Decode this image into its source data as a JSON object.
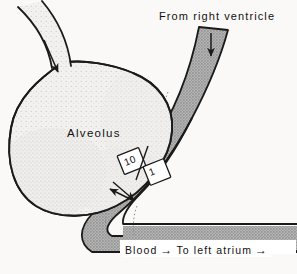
{
  "figure": {
    "background_color": "#faf9f7",
    "ink_color": "#1a1a1a",
    "vessel_fill_color": "#a9a9a9",
    "alveolus_fill_color": "#f1f0ee"
  },
  "labels": {
    "from_right_ventricle": "From right ventricle",
    "alveolus": "Alveolus",
    "blood": "Blood",
    "to_left_atrium": "To left atrium",
    "arrow_glyph": "→"
  },
  "ratio_boxes": [
    {
      "name": "alveolar-side-value",
      "value": "10"
    },
    {
      "name": "blood-side-value",
      "value": "1"
    }
  ],
  "flow_arrows": [
    {
      "name": "airway-inflow-arrow",
      "direction": "down-right",
      "location": "bronchiole"
    },
    {
      "name": "pulmonary-artery-inflow-arrow",
      "direction": "down",
      "location": "from-right-ventricle-vessel"
    },
    {
      "name": "gas-exchange-arrow-into-alveolus",
      "direction": "up-left",
      "location": "alveolar-capillary-membrane"
    },
    {
      "name": "gas-exchange-arrow-into-blood",
      "direction": "down-right",
      "location": "alveolar-capillary-membrane"
    },
    {
      "name": "blood-outflow-arrow",
      "direction": "right",
      "location": "pulmonary-vein"
    },
    {
      "name": "left-atrium-arrow",
      "direction": "right",
      "location": "pulmonary-vein-end"
    }
  ]
}
